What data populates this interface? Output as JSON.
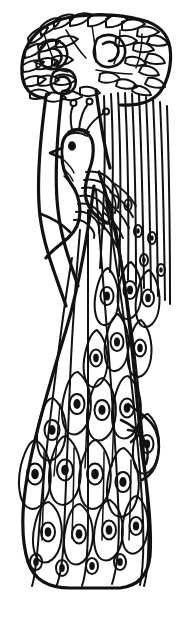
{
  "artwork": {
    "title": "Peacock in Tree",
    "subject": "peacock",
    "style": "black-and-white line art / coloring page",
    "background_color": "#ffffff",
    "ink_color": "#111111",
    "width_px": 178,
    "height_px": 621,
    "caption": "",
    "text_content": "none"
  },
  "regions": {
    "canopy": {
      "name": "leafy canopy with blossoms",
      "top_px": 14,
      "bottom_px": 110,
      "blossom_count": 3,
      "leaf_count": 58
    },
    "trunk": {
      "name": "tree trunk and branch",
      "top_px": 72,
      "bottom_px": 470
    },
    "bird": {
      "name": "peacock body",
      "head_center_x": 78,
      "head_center_y": 150,
      "crest_plume_count": 3,
      "eye": true,
      "beak": true,
      "wing_feather_count": 7,
      "leg": true
    },
    "tail": {
      "name": "cascading tail with ocelli",
      "top_px": 165,
      "bottom_px": 585,
      "strand_count": 14,
      "ocellus_count": 46
    }
  },
  "palette": {
    "paper": "#ffffff",
    "ink": "#111111"
  },
  "render": {
    "stroke_weight_fine": "1.5",
    "stroke_weight_medium": "2",
    "stroke_weight_bold": "3.2"
  }
}
